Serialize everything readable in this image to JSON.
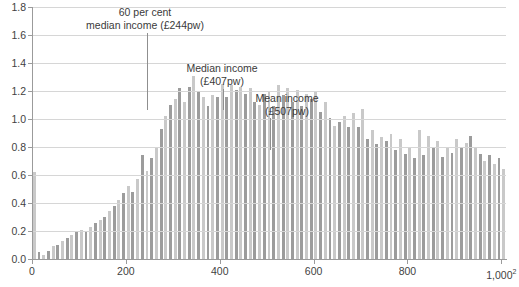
{
  "chart_data": {
    "type": "bar",
    "title": "",
    "subtitle": "",
    "xlabel": "",
    "ylabel": "",
    "xlim": [
      0,
      1010
    ],
    "ylim": [
      0,
      1.8
    ],
    "grid": true,
    "legend": "none",
    "x_ticks": [
      "0",
      "200",
      "400",
      "600",
      "800",
      "1,000"
    ],
    "x_tick_values": [
      0,
      200,
      400,
      600,
      800,
      1000
    ],
    "x_tick_footnote": "2",
    "y_ticks": [
      "0.0",
      "0.2",
      "0.4",
      "0.6",
      "0.8",
      "1.0",
      "1.2",
      "1.4",
      "1.6",
      "1.8"
    ],
    "y_tick_values": [
      0.0,
      0.2,
      0.4,
      0.6,
      0.8,
      1.0,
      1.2,
      1.4,
      1.6,
      1.8
    ],
    "bin_width": 10,
    "bar_colors": [
      "#c9c9c9",
      "#9c9c9c"
    ],
    "x": [
      0,
      10,
      20,
      30,
      40,
      50,
      60,
      70,
      80,
      90,
      100,
      110,
      120,
      130,
      140,
      150,
      160,
      170,
      180,
      190,
      200,
      210,
      220,
      230,
      240,
      250,
      260,
      270,
      280,
      290,
      300,
      310,
      320,
      330,
      340,
      350,
      360,
      370,
      380,
      390,
      400,
      410,
      420,
      430,
      440,
      450,
      460,
      470,
      480,
      490,
      500,
      510,
      520,
      530,
      540,
      550,
      560,
      570,
      580,
      590,
      600,
      610,
      620,
      630,
      640,
      650,
      660,
      670,
      680,
      690,
      700,
      710,
      720,
      730,
      740,
      750,
      760,
      770,
      780,
      790,
      800,
      810,
      820,
      830,
      840,
      850,
      860,
      870,
      880,
      890,
      900,
      910,
      920,
      930,
      940,
      950,
      960,
      970,
      980,
      990,
      1000
    ],
    "values": [
      0.62,
      0.05,
      0.03,
      0.06,
      0.09,
      0.1,
      0.13,
      0.15,
      0.17,
      0.19,
      0.21,
      0.2,
      0.23,
      0.26,
      0.28,
      0.3,
      0.34,
      0.38,
      0.42,
      0.47,
      0.52,
      0.48,
      0.57,
      0.74,
      0.63,
      0.72,
      0.8,
      0.93,
      1.02,
      1.1,
      1.14,
      1.22,
      1.12,
      1.23,
      1.31,
      1.2,
      1.16,
      1.09,
      1.17,
      1.16,
      1.25,
      1.16,
      1.24,
      1.21,
      1.23,
      1.18,
      1.22,
      1.12,
      1.1,
      1.18,
      1.2,
      1.09,
      1.24,
      1.17,
      1.22,
      1.12,
      1.21,
      1.09,
      1.18,
      1.14,
      1.2,
      1.05,
      1.12,
      1.01,
      0.95,
      0.98,
      1.02,
      0.94,
      1.04,
      0.94,
      1.07,
      0.86,
      0.92,
      0.82,
      0.87,
      0.84,
      0.89,
      0.78,
      0.86,
      0.75,
      0.8,
      0.72,
      0.92,
      0.74,
      0.88,
      0.79,
      0.84,
      0.73,
      0.8,
      0.76,
      0.86,
      0.79,
      0.83,
      0.88,
      0.8,
      0.75,
      0.7,
      0.74,
      0.68,
      0.72,
      0.64
    ],
    "annotations": [
      {
        "name": "low-income-threshold",
        "lines": [
          "60 per cent",
          "median income (£244pw)"
        ],
        "value": 244,
        "label": "60 per cent median income (£244pw)",
        "amount": "£244pw",
        "text_x": 145,
        "text_y": 6,
        "leader_top": 33,
        "leader_bottom": 110
      },
      {
        "name": "median-income",
        "lines": [
          "Median income",
          "(£407pw)"
        ],
        "value": 407,
        "label": "Median income (£407pw)",
        "amount": "£407pw",
        "text_x": 222,
        "text_y": 62,
        "leader_top": 89,
        "leader_bottom": 110
      },
      {
        "name": "mean-income",
        "lines": [
          "Mean income",
          "(£507pw)"
        ],
        "value": 507,
        "label": "Mean income (£507pw)",
        "amount": "£507pw",
        "text_x": 287,
        "text_y": 92,
        "leader_top": 118,
        "leader_bottom": 150
      }
    ]
  }
}
